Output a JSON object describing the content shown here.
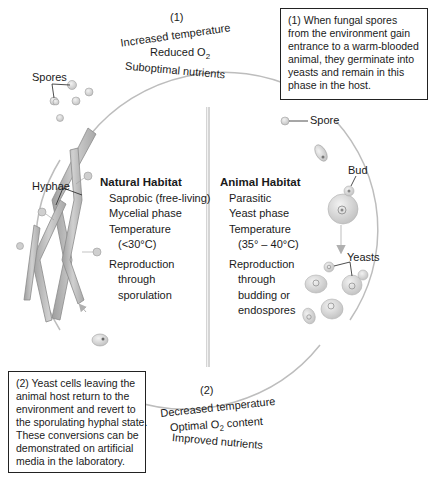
{
  "transition_top": {
    "number": "(1)",
    "conditions": [
      "Increased temperature",
      "Reduced O",
      "Suboptimal nutrients"
    ],
    "o2_subscript": "2"
  },
  "transition_bottom": {
    "number": "(2)",
    "conditions": [
      "Decreased temperature",
      "Optimal O",
      "Improved nutrients"
    ],
    "o2_subscript": "2",
    "o2_suffix": " content"
  },
  "box_top_right": {
    "lines": [
      "(1) When fungal spores",
      "from the environment gain",
      "entrance to a warm-blooded",
      "animal, they germinate into",
      "yeasts and remain in this",
      "phase in the host."
    ]
  },
  "box_bottom_left": {
    "lines": [
      "(2) Yeast cells leaving the",
      "animal host return to the",
      "environment and revert to",
      "the sporulating hyphal state.",
      "These conversions can be",
      "demonstrated on artificial",
      "media in the laboratory."
    ]
  },
  "natural_habitat": {
    "title": "Natural Habitat",
    "items": [
      {
        "text": "Saprobic (free-living)"
      },
      {
        "text": "Mycelial phase"
      },
      {
        "text": "Temperature",
        "sub": [
          "(<30°C)"
        ]
      },
      {
        "text": "Reproduction",
        "sub": [
          "through",
          "sporulation"
        ]
      }
    ]
  },
  "animal_habitat": {
    "title": "Animal Habitat",
    "items": [
      {
        "text": "Parasitic"
      },
      {
        "text": "Yeast phase"
      },
      {
        "text": "Temperature",
        "sub": [
          "(35° – 40°C)"
        ]
      },
      {
        "text": "Reproduction",
        "sub": [
          "through",
          "budding or",
          "endospores"
        ]
      }
    ]
  },
  "labels": {
    "spores": "Spores",
    "hyphae": "Hyphae",
    "spore": "Spore",
    "bud": "Bud",
    "yeasts": "Yeasts"
  },
  "colors": {
    "cycle_arrow": "#b8b8b8",
    "hyphae_fill": "#bdbdbd",
    "cell_fill": "#d9d9d9",
    "box_border": "#222222",
    "divider": "#c8c8c8"
  }
}
